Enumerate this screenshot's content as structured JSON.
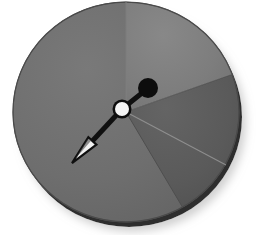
{
  "figure": {
    "canvas": {
      "width": 256,
      "height": 235
    },
    "background_color": "#ffffff"
  },
  "chart_data": {
    "type": "pie",
    "title": "",
    "subtitle": "",
    "xlabel": "",
    "ylabel": "",
    "grid": false,
    "legend_position": "none",
    "center": {
      "x": 126,
      "y": 112
    },
    "radius": 113,
    "rim_thickness": 7,
    "rim_color": "#2e2e2e",
    "edge_stroke_color": "#4a4a4a",
    "categories": [
      "left-sector",
      "upper-right-sector",
      "lower-right-sector"
    ],
    "values": [
      58.3,
      19.4,
      22.3
    ],
    "start_angle_deg": 90,
    "slices": [
      {
        "name": "left-sector",
        "label": "",
        "value": 58.3,
        "color": "#6e6e6e",
        "start_angle_deg": 90,
        "end_angle_deg": 332
      },
      {
        "name": "upper-right-sector",
        "label": "",
        "value": 19.4,
        "color": "#7d7d7d",
        "start_angle_deg": 20,
        "end_angle_deg": 90
      },
      {
        "name": "lower-right-sector",
        "label": "",
        "value": 22.3,
        "color": "#5a5a5a",
        "start_angle_deg": -60,
        "end_angle_deg": 20
      }
    ],
    "annotations": [
      {
        "name": "pointer-arrow",
        "kind": "arrow",
        "from": {
          "x": 122,
          "y": 109
        },
        "to": {
          "x": 72,
          "y": 163
        },
        "angle_deg": 227,
        "stroke_color": "#101010",
        "stroke_width": 5,
        "head_fill": "#f2f2f2",
        "head_stroke": "#101010",
        "head_length": 30,
        "head_width": 11
      },
      {
        "name": "pointer-tail-arm",
        "kind": "segment",
        "from": {
          "x": 122,
          "y": 109
        },
        "to": {
          "x": 147,
          "y": 89
        },
        "angle_deg": 39,
        "stroke_color": "#101010",
        "stroke_width": 5
      },
      {
        "name": "tail-knob",
        "kind": "dot",
        "center": {
          "x": 148,
          "y": 88
        },
        "radius": 10,
        "fill": "#0d0d0d"
      },
      {
        "name": "pivot-hub",
        "kind": "ring-dot",
        "center": {
          "x": 122,
          "y": 109
        },
        "radius": 8,
        "fill": "#f5f5f5",
        "stroke": "#0d0d0d",
        "stroke_width": 3
      }
    ],
    "shadow": {
      "name": "drop-shadow",
      "color": "#d9d9d9",
      "offset": {
        "x": 4,
        "y": 5
      },
      "blur": 6
    }
  }
}
